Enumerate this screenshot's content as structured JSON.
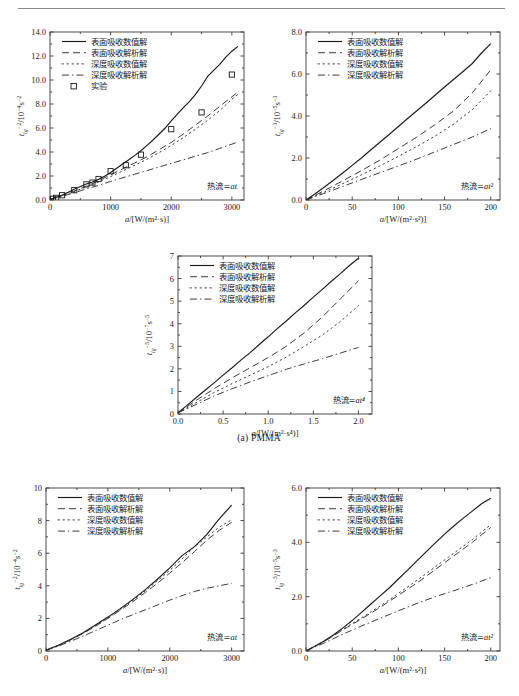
{
  "figure": {
    "caption_a": "(a) PMMA",
    "legend_labels": {
      "surface_numeric": "表面吸收数值解",
      "surface_analytic": "表面吸收解析解",
      "indepth_numeric": "深度吸收数值解",
      "indepth_analytic": "深度吸收解析解",
      "experiment": "实验"
    },
    "colors": {
      "ink": "#1a1a1a",
      "axis": "#3a3a3a",
      "rule": "#8a8a8a",
      "background": "#ffffff"
    }
  },
  "chart_data": [
    {
      "id": "chart-top-left",
      "type": "line",
      "title": "",
      "xlabel": "a/[W/(m²·s)]",
      "ylabel": "tᵢᵍ⁻²/10⁻⁴s⁻²",
      "ylabel_parts": {
        "base": "t",
        "sub": "ig",
        "sup": "−2",
        "tail": "/10",
        "tail_sup": "−4",
        "unit": "s",
        "unit_sup": "−2"
      },
      "annotation": "热流=at",
      "xlim": [
        0,
        3200
      ],
      "ylim": [
        0,
        14.0
      ],
      "xticks": [
        0,
        1000,
        2000,
        3000
      ],
      "xticklabels": [
        "0",
        "1000",
        "2000",
        "3000"
      ],
      "yticks": [
        0.0,
        2.0,
        4.0,
        6.0,
        8.0,
        10.0,
        12.0,
        14.0
      ],
      "yticklabels": [
        "0.0",
        "2.0",
        "4.0",
        "6.0",
        "8.0",
        "10.0",
        "12.0",
        "14.0"
      ],
      "grid": false,
      "legend_position": "upper-left",
      "legend_entries": [
        "表面吸收数值解",
        "表面吸收解析解",
        "深度吸收数值解",
        "深度吸收解析解",
        "实验"
      ],
      "series": [
        {
          "name": "表面吸收数值解",
          "style": "solid",
          "x": [
            0,
            100,
            200,
            300,
            400,
            500,
            600,
            700,
            800,
            900,
            1000,
            1100,
            1200,
            1300,
            1400,
            1500,
            1600,
            1700,
            1800,
            1900,
            2000,
            2100,
            2200,
            2300,
            2400,
            2500,
            2600,
            2700,
            2800,
            2900,
            3000,
            3100
          ],
          "y": [
            0.05,
            0.22,
            0.42,
            0.65,
            0.9,
            1.12,
            1.33,
            1.5,
            1.72,
            1.98,
            2.3,
            2.65,
            3.0,
            3.35,
            3.72,
            4.1,
            4.55,
            5.0,
            5.5,
            6.0,
            6.6,
            7.15,
            7.7,
            8.2,
            8.8,
            9.5,
            10.3,
            10.8,
            11.3,
            11.9,
            12.4,
            12.8
          ]
        },
        {
          "name": "表面吸收解析解",
          "style": "dashed",
          "x": [
            0,
            200,
            400,
            600,
            800,
            1000,
            1200,
            1400,
            1600,
            1800,
            2000,
            2200,
            2400,
            2600,
            2800,
            3000,
            3100
          ],
          "y": [
            0.05,
            0.38,
            0.75,
            1.15,
            1.6,
            2.1,
            2.6,
            3.1,
            3.6,
            4.2,
            4.8,
            5.5,
            6.25,
            7.0,
            7.8,
            8.6,
            9.0
          ]
        },
        {
          "name": "深度吸收数值解",
          "style": "dotted",
          "x": [
            0,
            200,
            400,
            600,
            800,
            1000,
            1200,
            1400,
            1600,
            1800,
            2000,
            2200,
            2400,
            2600,
            2800,
            3000,
            3100
          ],
          "y": [
            0.05,
            0.35,
            0.7,
            1.1,
            1.5,
            1.95,
            2.42,
            2.9,
            3.4,
            3.95,
            4.55,
            5.2,
            5.9,
            6.65,
            7.45,
            8.4,
            8.8
          ]
        },
        {
          "name": "深度吸收解析解",
          "style": "dashdot",
          "x": [
            0,
            200,
            400,
            600,
            800,
            1000,
            1200,
            1400,
            1600,
            1800,
            2000,
            2200,
            2400,
            2600,
            2800,
            3000,
            3100
          ],
          "y": [
            0.05,
            0.3,
            0.6,
            0.92,
            1.22,
            1.55,
            1.85,
            2.15,
            2.45,
            2.75,
            3.05,
            3.35,
            3.65,
            3.95,
            4.3,
            4.65,
            4.85
          ]
        }
      ],
      "scatter": {
        "name": "实验",
        "marker": "square-open",
        "x": [
          50,
          100,
          200,
          400,
          600,
          700,
          800,
          1000,
          1250,
          1500,
          2000,
          2500,
          3000
        ],
        "y": [
          0.1,
          0.18,
          0.4,
          0.82,
          1.3,
          1.45,
          1.75,
          2.4,
          2.9,
          3.78,
          5.9,
          7.3,
          10.45
        ]
      }
    },
    {
      "id": "chart-top-right",
      "type": "line",
      "title": "",
      "xlabel": "a/[W/(m²·s²)]",
      "ylabel": "tᵢᵍ⁻³/10⁻⁵s⁻³",
      "ylabel_parts": {
        "base": "t",
        "sub": "ig",
        "sup": "−3",
        "tail": "/10",
        "tail_sup": "−5",
        "unit": "s",
        "unit_sup": "−3"
      },
      "annotation": "热流=at²",
      "xlim": [
        0,
        210
      ],
      "ylim": [
        0,
        8.0
      ],
      "xticks": [
        0,
        50,
        100,
        150,
        200
      ],
      "xticklabels": [
        "0",
        "50",
        "100",
        "150",
        "200"
      ],
      "yticks": [
        0.0,
        2.0,
        4.0,
        6.0,
        8.0
      ],
      "yticklabels": [
        "0.0",
        "2.0",
        "4.0",
        "6.0",
        "8.0"
      ],
      "grid": false,
      "legend_position": "upper-left",
      "legend_entries": [
        "表面吸收数值解",
        "表面吸收解析解",
        "深度吸收数值解",
        "深度吸收解析解"
      ],
      "series": [
        {
          "name": "表面吸收数值解",
          "style": "solid",
          "x": [
            0,
            10,
            20,
            30,
            40,
            50,
            60,
            70,
            80,
            90,
            100,
            110,
            120,
            130,
            140,
            150,
            160,
            170,
            180,
            190,
            200
          ],
          "y": [
            0.0,
            0.3,
            0.62,
            0.95,
            1.3,
            1.65,
            2.0,
            2.38,
            2.75,
            3.12,
            3.5,
            3.88,
            4.25,
            4.62,
            5.0,
            5.38,
            5.75,
            6.12,
            6.5,
            7.0,
            7.45
          ]
        },
        {
          "name": "表面吸收解析解",
          "style": "dashed",
          "x": [
            0,
            20,
            40,
            60,
            80,
            100,
            120,
            140,
            160,
            180,
            200
          ],
          "y": [
            0.0,
            0.45,
            0.92,
            1.4,
            1.9,
            2.45,
            3.0,
            3.6,
            4.25,
            5.1,
            6.2
          ]
        },
        {
          "name": "深度吸收数值解",
          "style": "dotted",
          "x": [
            0,
            20,
            40,
            60,
            80,
            100,
            120,
            140,
            160,
            180,
            200
          ],
          "y": [
            0.0,
            0.38,
            0.78,
            1.2,
            1.62,
            2.08,
            2.55,
            3.05,
            3.62,
            4.3,
            5.2
          ]
        },
        {
          "name": "深度吸收解析解",
          "style": "dashdot",
          "x": [
            0,
            20,
            40,
            60,
            80,
            100,
            120,
            140,
            160,
            180,
            200
          ],
          "y": [
            0.0,
            0.32,
            0.65,
            0.98,
            1.3,
            1.62,
            1.95,
            2.3,
            2.65,
            3.0,
            3.4
          ]
        }
      ],
      "scatter": null
    },
    {
      "id": "chart-middle",
      "type": "line",
      "title": "",
      "xlabel": "a/[W/(m²·s⁴)]",
      "ylabel": "tᵢᵍ⁻⁵/10⁻⁷s⁻⁵",
      "ylabel_parts": {
        "base": "t",
        "sub": "ig",
        "sup": "−5",
        "tail": "/10",
        "tail_sup": "−7",
        "unit": "s",
        "unit_sup": "−5"
      },
      "annotation": "热流=at⁴",
      "xlim": [
        0,
        2.15
      ],
      "ylim": [
        0,
        7
      ],
      "xticks": [
        0.0,
        0.5,
        1.0,
        1.5,
        2.0
      ],
      "xticklabels": [
        "0.0",
        "0.5",
        "1.0",
        "1.5",
        "2.0"
      ],
      "yticks": [
        0,
        1,
        2,
        3,
        4,
        5,
        6,
        7
      ],
      "yticklabels": [
        "0",
        "1",
        "2",
        "3",
        "4",
        "5",
        "6",
        "7"
      ],
      "grid": false,
      "legend_position": "upper-left",
      "legend_entries": [
        "表面吸收数值解",
        "表面吸收解析解",
        "深度吸收数值解",
        "深度吸收解析解"
      ],
      "series": [
        {
          "name": "表面吸收数值解",
          "style": "solid",
          "x": [
            0,
            0.1,
            0.2,
            0.3,
            0.4,
            0.5,
            0.6,
            0.7,
            0.8,
            0.9,
            1.0,
            1.1,
            1.2,
            1.3,
            1.4,
            1.5,
            1.6,
            1.7,
            1.8,
            1.9,
            2.0
          ],
          "y": [
            0.05,
            0.38,
            0.72,
            1.05,
            1.38,
            1.72,
            2.05,
            2.4,
            2.72,
            3.08,
            3.42,
            3.78,
            4.12,
            4.48,
            4.82,
            5.18,
            5.52,
            5.88,
            6.22,
            6.58,
            6.9
          ]
        },
        {
          "name": "表面吸收解析解",
          "style": "dashed",
          "x": [
            0,
            0.2,
            0.4,
            0.6,
            0.8,
            1.0,
            1.2,
            1.4,
            1.6,
            1.8,
            2.0
          ],
          "y": [
            0.05,
            0.6,
            1.12,
            1.6,
            2.05,
            2.5,
            3.0,
            3.6,
            4.3,
            5.1,
            5.9
          ]
        },
        {
          "name": "深度吸收数值解",
          "style": "dotted",
          "x": [
            0,
            0.2,
            0.4,
            0.6,
            0.8,
            1.0,
            1.2,
            1.4,
            1.6,
            1.8,
            2.0
          ],
          "y": [
            0.05,
            0.5,
            0.95,
            1.35,
            1.72,
            2.1,
            2.52,
            3.0,
            3.5,
            4.1,
            4.8
          ]
        },
        {
          "name": "深度吸收解析解",
          "style": "dashdot",
          "x": [
            0,
            0.2,
            0.4,
            0.6,
            0.8,
            1.0,
            1.2,
            1.4,
            1.6,
            1.8,
            2.0
          ],
          "y": [
            0.05,
            0.42,
            0.8,
            1.12,
            1.42,
            1.7,
            1.98,
            2.22,
            2.45,
            2.7,
            2.95
          ]
        }
      ],
      "scatter": null
    },
    {
      "id": "chart-bottom-left",
      "type": "line",
      "title": "",
      "xlabel": "a/[W/(m²·s)]",
      "ylabel": "tᵢᵍ⁻²/10⁻⁴s⁻²",
      "ylabel_parts": {
        "base": "t",
        "sub": "ig",
        "sup": "−2",
        "tail": "/10",
        "tail_sup": "−4",
        "unit": "s",
        "unit_sup": "−2"
      },
      "annotation": "热流=at",
      "xlim": [
        0,
        3200
      ],
      "ylim": [
        0,
        10
      ],
      "xticks": [
        0,
        1000,
        2000,
        3000
      ],
      "xticklabels": [
        "0",
        "1000",
        "2000",
        "3000"
      ],
      "yticks": [
        0,
        2,
        4,
        6,
        8,
        10
      ],
      "yticklabels": [
        "0",
        "2",
        "4",
        "6",
        "8",
        "10"
      ],
      "grid": false,
      "legend_position": "upper-left",
      "legend_entries": [
        "表面吸收数值解",
        "表面吸收解析解",
        "深度吸收数值解",
        "深度吸收解析解"
      ],
      "series": [
        {
          "name": "表面吸收数值解",
          "style": "solid",
          "x": [
            0,
            200,
            400,
            600,
            800,
            1000,
            1200,
            1400,
            1600,
            1800,
            2000,
            2200,
            2400,
            2600,
            2800,
            3000
          ],
          "y": [
            0.05,
            0.35,
            0.72,
            1.12,
            1.6,
            2.08,
            2.6,
            3.15,
            3.75,
            4.4,
            5.1,
            5.85,
            6.4,
            7.15,
            8.1,
            8.95
          ]
        },
        {
          "name": "表面吸收解析解",
          "style": "dashed",
          "x": [
            0,
            200,
            400,
            600,
            800,
            1000,
            1200,
            1400,
            1600,
            1800,
            2000,
            2200,
            2400,
            2600,
            2800,
            3000
          ],
          "y": [
            0.05,
            0.32,
            0.68,
            1.08,
            1.52,
            2.0,
            2.5,
            3.02,
            3.58,
            4.15,
            4.78,
            5.42,
            6.1,
            6.8,
            7.4,
            7.9
          ]
        },
        {
          "name": "深度吸收数值解",
          "style": "dotted",
          "x": [
            0,
            200,
            400,
            600,
            800,
            1000,
            1200,
            1400,
            1600,
            1800,
            2000,
            2200,
            2400,
            2600,
            2800,
            3000
          ],
          "y": [
            0.05,
            0.33,
            0.7,
            1.1,
            1.55,
            2.02,
            2.55,
            3.1,
            3.68,
            4.3,
            4.95,
            5.65,
            6.4,
            7.0,
            7.6,
            8.05
          ]
        },
        {
          "name": "深度吸收解析解",
          "style": "dashdot",
          "x": [
            0,
            200,
            400,
            600,
            800,
            1000,
            1200,
            1400,
            1600,
            1800,
            2000,
            2200,
            2400,
            2600,
            2800,
            3000
          ],
          "y": [
            0.05,
            0.3,
            0.6,
            0.92,
            1.25,
            1.58,
            1.92,
            2.22,
            2.52,
            2.82,
            3.12,
            3.4,
            3.65,
            3.85,
            4.0,
            4.15
          ]
        }
      ],
      "scatter": null
    },
    {
      "id": "chart-bottom-right",
      "type": "line",
      "title": "",
      "xlabel": "a/[W/(m²·s²)]",
      "ylabel": "tᵢᵍ⁻³/10⁻⁵s⁻³",
      "ylabel_parts": {
        "base": "t",
        "sub": "ig",
        "sup": "−3",
        "tail": "/10",
        "tail_sup": "−5",
        "unit": "s",
        "unit_sup": "−3"
      },
      "annotation": "热流=at²",
      "xlim": [
        0,
        210
      ],
      "ylim": [
        0,
        6.0
      ],
      "xticks": [
        0,
        50,
        100,
        150,
        200
      ],
      "xticklabels": [
        "0",
        "50",
        "100",
        "150",
        "200"
      ],
      "yticks": [
        0.0,
        2.0,
        4.0,
        6.0
      ],
      "yticklabels": [
        "0.0",
        "2.0",
        "4.0",
        "6.0"
      ],
      "grid": false,
      "legend_position": "upper-left",
      "legend_entries": [
        "表面吸收数值解",
        "表面吸收解析解",
        "深度吸收数值解",
        "深度吸收解析解"
      ],
      "series": [
        {
          "name": "表面吸收数值解",
          "style": "solid",
          "x": [
            0,
            10,
            20,
            30,
            40,
            50,
            60,
            70,
            80,
            90,
            100,
            110,
            120,
            130,
            140,
            150,
            160,
            170,
            180,
            190,
            200
          ],
          "y": [
            0.0,
            0.18,
            0.38,
            0.6,
            0.85,
            1.12,
            1.42,
            1.72,
            2.02,
            2.32,
            2.65,
            2.98,
            3.32,
            3.65,
            3.98,
            4.3,
            4.6,
            4.88,
            5.15,
            5.42,
            5.62
          ]
        },
        {
          "name": "表面吸收解析解",
          "style": "dashed",
          "x": [
            0,
            20,
            40,
            60,
            80,
            100,
            120,
            140,
            160,
            180,
            200
          ],
          "y": [
            0.0,
            0.35,
            0.78,
            1.18,
            1.6,
            2.05,
            2.5,
            3.0,
            3.5,
            4.0,
            4.55
          ]
        },
        {
          "name": "深度吸收数值解",
          "style": "dotted",
          "x": [
            0,
            20,
            40,
            60,
            80,
            100,
            120,
            140,
            160,
            180,
            200
          ],
          "y": [
            0.0,
            0.36,
            0.8,
            1.22,
            1.65,
            2.12,
            2.6,
            3.1,
            3.6,
            4.1,
            4.65
          ]
        },
        {
          "name": "深度吸收解析解",
          "style": "dashdot",
          "x": [
            0,
            20,
            40,
            60,
            80,
            100,
            120,
            140,
            160,
            180,
            200
          ],
          "y": [
            0.0,
            0.3,
            0.62,
            0.92,
            1.2,
            1.48,
            1.75,
            2.0,
            2.22,
            2.45,
            2.7
          ]
        }
      ],
      "scatter": null
    }
  ]
}
